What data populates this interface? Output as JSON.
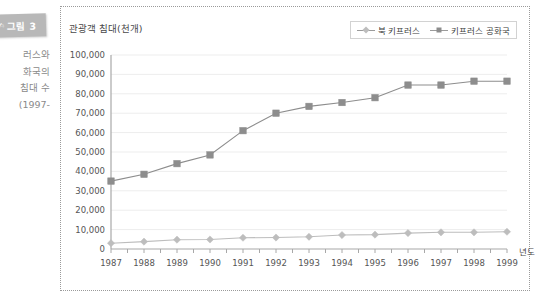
{
  "figure": {
    "badge_mark": "✍",
    "badge_label": "그림 3",
    "caption_lines": [
      "러스와",
      "화국의",
      "침대 수",
      "-1997)"
    ]
  },
  "legend": {
    "items": [
      {
        "label": "북 키프러스",
        "marker": "diamond-marker",
        "color": "#bdbdbd"
      },
      {
        "label": "키프러스 공화국",
        "marker": "square-marker",
        "color": "#8d8d8d"
      }
    ]
  },
  "colors": {
    "series_north_cyprus": "#bdbdbd",
    "series_republic_cyprus": "#8d8d8d",
    "gridline": "#ededed",
    "axis": "#a8a8a8",
    "panel_border": "#9a9a9a",
    "badge_background": "#b8b8b8"
  },
  "chart_data": {
    "type": "line",
    "title": "관광객 침대(천개)",
    "xlabel": "년도",
    "ylabel": "",
    "categories": [
      "1987",
      "1988",
      "1989",
      "1990",
      "1991",
      "1992",
      "1993",
      "1994",
      "1995",
      "1996",
      "1997",
      "1998",
      "1999"
    ],
    "ylim": [
      0,
      100000
    ],
    "ytick_labels": [
      "100,000",
      "90,000",
      "80,000",
      "70,000",
      "60,000",
      "50,000",
      "40,000",
      "30,000",
      "20,000",
      "10,000",
      "0"
    ],
    "ytick_values": [
      100000,
      90000,
      80000,
      70000,
      60000,
      50000,
      40000,
      30000,
      20000,
      10000,
      0
    ],
    "ytick_step": 10000,
    "grid": true,
    "legend_position": "top-right",
    "series": [
      {
        "name": "북 키프러스",
        "marker": "diamond",
        "color": "#bdbdbd",
        "values": [
          3000,
          3800,
          4800,
          4900,
          5800,
          5900,
          6300,
          7200,
          7400,
          8200,
          8600,
          8600,
          8900
        ]
      },
      {
        "name": "키프러스 공화국",
        "marker": "square",
        "color": "#8d8d8d",
        "values": [
          35000,
          38500,
          44000,
          48500,
          61000,
          70000,
          73500,
          75500,
          78000,
          84500,
          84500,
          86500,
          86500
        ]
      }
    ]
  }
}
